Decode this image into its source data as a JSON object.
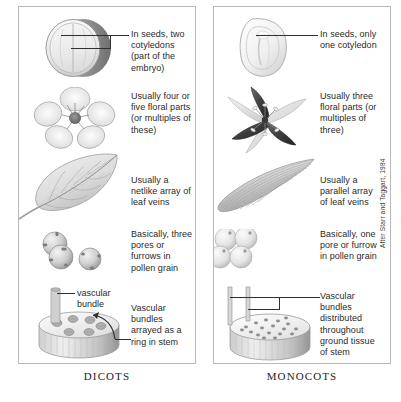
{
  "figure": {
    "credit": "After Starr and Taggart, 1984"
  },
  "panels": [
    {
      "id": "dicots",
      "caption": "DICOTS",
      "rows": [
        {
          "id": "seed",
          "art_name": "dicot-seed-illustration",
          "text": "In seeds, two cotyledons (part of the embryo)"
        },
        {
          "id": "flower",
          "art_name": "dicot-flower-illustration",
          "text": "Usually four or five floral parts (or multiples of these)"
        },
        {
          "id": "leaf",
          "art_name": "dicot-leaf-illustration",
          "text": "Usually a netlike array of leaf veins"
        },
        {
          "id": "pollen",
          "art_name": "dicot-pollen-illustration",
          "text": "Basically, three pores or furrows in pollen grain"
        },
        {
          "id": "stem",
          "art_name": "dicot-stem-illustration",
          "text": "Vascular bundles arrayed as a ring in stem",
          "inline_label": "vascular bundle"
        }
      ]
    },
    {
      "id": "monocots",
      "caption": "MONOCOTS",
      "rows": [
        {
          "id": "seed",
          "art_name": "monocot-seed-illustration",
          "text": "In seeds, only one cotyledon"
        },
        {
          "id": "flower",
          "art_name": "monocot-flower-illustration",
          "text": "Usually three floral parts (or multiples of three)"
        },
        {
          "id": "leaf",
          "art_name": "monocot-leaf-illustration",
          "text": "Usually a parallel array of leaf veins"
        },
        {
          "id": "pollen",
          "art_name": "monocot-pollen-illustration",
          "text": "Basically, one pore or furrow in pollen grain"
        },
        {
          "id": "stem",
          "art_name": "monocot-stem-illustration",
          "text": "Vascular bundles distributed throughout ground tissue of stem"
        }
      ]
    }
  ],
  "colors": {
    "border": "#b9b9b9",
    "leader": "#2f2f2f",
    "text": "#2a2a2a",
    "art_light": "#e8e8e8",
    "art_mid": "#b8b8b8",
    "art_dark": "#6a6a6a"
  }
}
